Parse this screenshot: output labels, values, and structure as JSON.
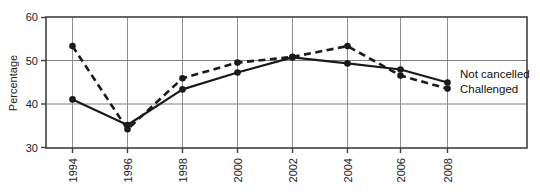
{
  "chart_data": {
    "type": "line",
    "title": "",
    "xlabel": "",
    "ylabel": "Percentage",
    "categories": [
      "1994",
      "1996",
      "1998",
      "2000",
      "2002",
      "2004",
      "2006",
      "2008"
    ],
    "x": [
      1994,
      1996,
      1998,
      2000,
      2002,
      2004,
      2006,
      2008
    ],
    "ylim": [
      30,
      60
    ],
    "yticks": [
      30,
      40,
      50,
      60
    ],
    "ytick_labels": [
      "30",
      "40",
      "50",
      "60"
    ],
    "grid": true,
    "grid_axis": "both",
    "legend_position": "right-inline-line-end",
    "series": [
      {
        "name": "Not cancelled",
        "style": "solid",
        "marker": "filled-circle",
        "color": "#1a1a1a",
        "values": [
          41.1,
          35.2,
          43.4,
          47.3,
          50.8,
          49.4,
          48.0,
          45.0
        ]
      },
      {
        "name": "Challenged",
        "style": "dashed",
        "marker": "filled-circle",
        "color": "#1a1a1a",
        "values": [
          53.4,
          34.2,
          46.0,
          49.6,
          50.9,
          53.4,
          46.6,
          43.6
        ]
      }
    ]
  },
  "axes": {
    "y_title": "Percentage",
    "y_tick_0": "30",
    "y_tick_1": "40",
    "y_tick_2": "50",
    "y_tick_3": "60",
    "x_tick_0": "1994",
    "x_tick_1": "1996",
    "x_tick_2": "1998",
    "x_tick_3": "2000",
    "x_tick_4": "2002",
    "x_tick_5": "2004",
    "x_tick_6": "2006",
    "x_tick_7": "2008"
  },
  "legend": {
    "not_cancelled": "Not cancelled",
    "challenged": "Challenged"
  },
  "colors": {
    "line": "#1a1a1a",
    "grid": "#808080",
    "frame": "#404040",
    "text": "#222222",
    "background": "#ffffff"
  }
}
